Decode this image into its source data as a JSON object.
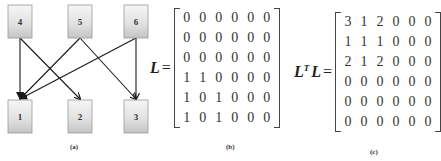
{
  "panel_a": {
    "caption": "(a)",
    "nodes": [
      {
        "id": "4",
        "label": "4",
        "row": "top"
      },
      {
        "id": "5",
        "label": "5",
        "row": "top"
      },
      {
        "id": "6",
        "label": "6",
        "row": "top"
      },
      {
        "id": "1",
        "label": "1",
        "row": "bottom"
      },
      {
        "id": "2",
        "label": "2",
        "row": "bottom"
      },
      {
        "id": "3",
        "label": "3",
        "row": "bottom"
      }
    ],
    "edges": [
      {
        "from": "4",
        "to": "1"
      },
      {
        "from": "4",
        "to": "2"
      },
      {
        "from": "5",
        "to": "1"
      },
      {
        "from": "5",
        "to": "3"
      },
      {
        "from": "6",
        "to": "1"
      },
      {
        "from": "6",
        "to": "3"
      }
    ]
  },
  "panel_b": {
    "caption": "(b)",
    "label": "L",
    "equals": "=",
    "matrix": [
      [
        0,
        0,
        0,
        0,
        0,
        0
      ],
      [
        0,
        0,
        0,
        0,
        0,
        0
      ],
      [
        0,
        0,
        0,
        0,
        0,
        0
      ],
      [
        1,
        1,
        0,
        0,
        0,
        0
      ],
      [
        1,
        0,
        1,
        0,
        0,
        0
      ],
      [
        1,
        0,
        1,
        0,
        0,
        0
      ]
    ]
  },
  "panel_c": {
    "caption": "(c)",
    "label": "L",
    "superscript": "T",
    "label2": "L",
    "equals": "=",
    "matrix": [
      [
        3,
        1,
        2,
        0,
        0,
        0
      ],
      [
        1,
        1,
        1,
        0,
        0,
        0
      ],
      [
        2,
        1,
        2,
        0,
        0,
        0
      ],
      [
        0,
        0,
        0,
        0,
        0,
        0
      ],
      [
        0,
        0,
        0,
        0,
        0,
        0
      ],
      [
        0,
        0,
        0,
        0,
        0,
        0
      ]
    ]
  },
  "colors": {
    "node_top": "#f4f4f4",
    "node_bottom": "#c8c8c8",
    "node_border": "#9a9a9a",
    "edge": "#1a1a1a"
  }
}
